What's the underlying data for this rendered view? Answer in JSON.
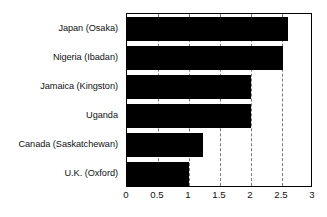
{
  "chart_data": {
    "type": "bar",
    "orientation": "horizontal",
    "title": "",
    "subtitle": "",
    "xlabel": "",
    "ylabel": "",
    "categories": [
      "Japan (Osaka)",
      "Nigeria (Ibadan)",
      "Jamaica (Kingston)",
      "Uganda",
      "Canada (Saskatchewan)",
      "U.K. (Oxford)"
    ],
    "values": [
      2.6,
      2.52,
      2.0,
      2.0,
      1.22,
      1.0
    ],
    "xlim": [
      0,
      3
    ],
    "ylim": null,
    "xticks": [
      0,
      0.5,
      1,
      1.5,
      2,
      2.5,
      3
    ],
    "xticklabels": [
      "0",
      "0.5",
      "1",
      "1.5",
      "2",
      "2.5",
      "3"
    ],
    "grid": "vertical-dashed",
    "legend": null,
    "legend_position": "none",
    "bar_color": "#000000",
    "plot_border_color": "#000000",
    "gridline_color": "#7a7a7a",
    "background_color": "#ffffff"
  }
}
